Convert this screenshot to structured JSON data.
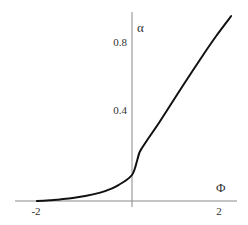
{
  "chart_data": {
    "type": "line",
    "title": "",
    "xlabel": "Φ",
    "ylabel": "α",
    "xlim": [
      -2.5,
      2.3
    ],
    "ylim": [
      0,
      0.95
    ],
    "grid": false,
    "legend": null,
    "x_ticks": [
      {
        "value": -2,
        "label": "-2"
      },
      {
        "value": 2,
        "label": "2"
      }
    ],
    "y_ticks": [
      {
        "value": 0.4,
        "label": "0.4"
      },
      {
        "value": 0.8,
        "label": "0.8"
      }
    ],
    "series": [
      {
        "name": "alpha(Phi)",
        "color": "#111111",
        "x": [
          -2.09,
          -1.8,
          -1.58,
          -1.3,
          -1.0,
          -0.7,
          -0.45,
          -0.26,
          -0.12,
          0.0,
          0.06,
          0.11,
          0.16,
          0.22,
          0.35,
          0.62,
          1.0,
          1.49,
          1.85,
          2.18
        ],
        "y": [
          0.0,
          0.004,
          0.008,
          0.015,
          0.026,
          0.042,
          0.062,
          0.085,
          0.105,
          0.13,
          0.16,
          0.2,
          0.24,
          0.265,
          0.31,
          0.4,
          0.535,
          0.705,
          0.825,
          0.925
        ]
      }
    ]
  },
  "axes": {
    "x_title": "Φ",
    "y_title": "α",
    "x_tick_labels": [
      "-2",
      "2"
    ],
    "y_tick_labels": [
      "0.4",
      "0.8"
    ]
  }
}
